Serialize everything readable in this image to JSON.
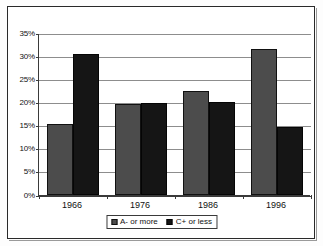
{
  "chart_data": {
    "type": "bar",
    "title": "",
    "subtitle": "",
    "xlabel": "",
    "ylabel": "",
    "categories": [
      "1966",
      "1976",
      "1986",
      "1996"
    ],
    "series": [
      {
        "name": "A- or more",
        "color": "#4c4c4c",
        "values": [
          15.4,
          19.7,
          22.5,
          31.5
        ]
      },
      {
        "name": "C+ or less",
        "color": "#151515",
        "values": [
          30.4,
          19.8,
          20.2,
          14.6
        ]
      }
    ],
    "ylim": [
      0,
      35
    ],
    "ytick_values": [
      0,
      5,
      10,
      15,
      20,
      25,
      30,
      35
    ],
    "ytick_labels": [
      "0%",
      "5%",
      "10%",
      "15%",
      "20%",
      "25%",
      "30%",
      "35%"
    ],
    "grid": true,
    "legend_position": "bottom",
    "annotations": []
  },
  "legend": {
    "items": [
      {
        "label": "A- or more",
        "marker": "square-marker"
      },
      {
        "label": "C+ or less",
        "marker": "square-marker"
      }
    ]
  },
  "colors": {
    "series_a": "#4c4c4c",
    "series_b": "#151515",
    "gridline": "#8d8d8d",
    "axis": "#3a3a3a",
    "frame": "#2a2a2a",
    "background": "#ffffff",
    "text": "#111111"
  }
}
